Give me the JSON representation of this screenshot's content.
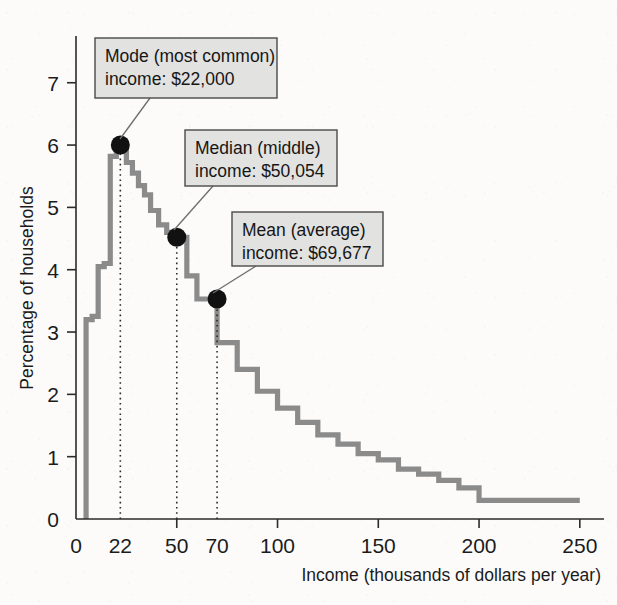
{
  "figure": {
    "title_internal": "Income distribution of U.S. households",
    "background_color": "#fcfbfa",
    "curve_color": "#8b8b8b",
    "axis_color": "#2b2b2b",
    "callout_fill": "#e2e2e0",
    "callout_border": "#4a4a4a",
    "marker_color": "#111111"
  },
  "axes": {
    "x_label": "Income (thousands of dollars per year)",
    "y_label": "Percentage of households",
    "x_ticks": [
      0,
      22,
      50,
      70,
      100,
      150,
      200,
      250
    ],
    "x_tick_labels": [
      "0",
      "22",
      "50",
      "70",
      "100",
      "150",
      "200",
      "250"
    ],
    "x_major_ticks": [
      0,
      50,
      100,
      150,
      200,
      250
    ],
    "y_ticks": [
      0,
      1,
      2,
      3,
      4,
      5,
      6,
      7
    ],
    "y_tick_labels": [
      "0",
      "1",
      "2",
      "3",
      "4",
      "5",
      "6",
      "7"
    ],
    "xlim": [
      0,
      262
    ],
    "ylim": [
      0,
      7.75
    ],
    "grid": false
  },
  "callouts": [
    {
      "id": "mode",
      "line1": "Mode (most common)",
      "line2": "income: $22,000",
      "box": {
        "x": 95,
        "y": 38,
        "w": 182,
        "h": 60
      },
      "leader_from": {
        "x": 150,
        "y": 98
      },
      "leader_to": {
        "x": 120,
        "y": 139
      },
      "point": {
        "x": 22,
        "y": 6.0
      }
    },
    {
      "id": "median",
      "line1": "Median (middle)",
      "line2": "income: $50,054",
      "box": {
        "x": 185,
        "y": 130,
        "w": 152,
        "h": 56
      },
      "leader_from": {
        "x": 213,
        "y": 186
      },
      "leader_to": {
        "x": 174,
        "y": 230
      },
      "point": {
        "x": 50,
        "y": 4.52
      }
    },
    {
      "id": "mean",
      "line1": "Mean (average)",
      "line2": "income: $69,677",
      "box": {
        "x": 232,
        "y": 212,
        "w": 151,
        "h": 54
      },
      "leader_from": {
        "x": 256,
        "y": 266
      },
      "leader_to": {
        "x": 213,
        "y": 293
      },
      "point": {
        "x": 70,
        "y": 3.53
      }
    }
  ],
  "dotted_guides": [
    22,
    50,
    70
  ],
  "chart_data": {
    "type": "area",
    "xlabel": "Income (thousands of dollars per year)",
    "ylabel": "Percentage of households",
    "xlim": [
      0,
      262
    ],
    "ylim": [
      0,
      7.75
    ],
    "grid": false,
    "legend": null,
    "series": [
      {
        "name": "Percentage of households",
        "style": "step",
        "color": "#8b8b8b",
        "x": [
          5,
          8,
          11,
          14,
          17,
          20,
          22,
          25,
          28,
          31,
          34,
          37,
          41,
          45,
          50,
          55,
          60,
          70,
          80,
          90,
          100,
          110,
          120,
          130,
          140,
          150,
          160,
          170,
          180,
          190,
          200,
          250
        ],
        "y": [
          3.2,
          3.25,
          4.05,
          4.1,
          5.82,
          5.92,
          6.0,
          5.72,
          5.55,
          5.35,
          5.2,
          4.95,
          4.72,
          4.6,
          4.52,
          3.9,
          3.53,
          2.83,
          2.4,
          2.05,
          1.78,
          1.55,
          1.35,
          1.2,
          1.05,
          0.95,
          0.8,
          0.72,
          0.62,
          0.5,
          0.3,
          0.3
        ]
      }
    ],
    "markers": [
      {
        "label": "Mode",
        "x": 22,
        "y": 6.0,
        "value_text": "$22,000"
      },
      {
        "label": "Median",
        "x": 50,
        "y": 4.52,
        "value_text": "$50,054"
      },
      {
        "label": "Mean",
        "x": 70,
        "y": 3.53,
        "value_text": "$69,677"
      }
    ],
    "annotations": [
      "Mode (most common) income: $22,000",
      "Median (middle) income: $50,054",
      "Mean (average) income: $69,677"
    ]
  }
}
